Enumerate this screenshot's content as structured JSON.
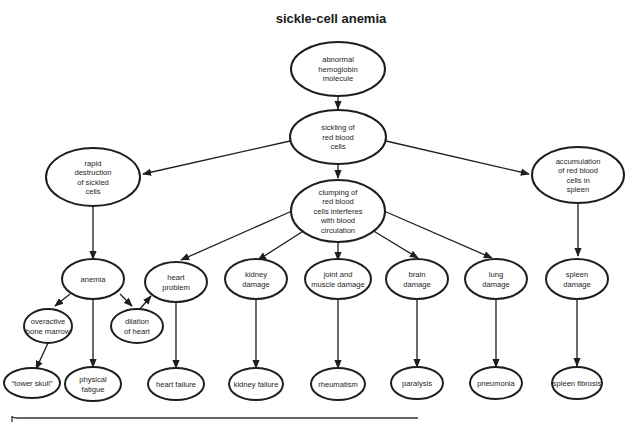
{
  "title": "sickle-cell anemia",
  "nodes": {
    "abnormal_hemoglobin": {
      "lines": [
        "abnormal",
        "hemoglobin",
        "molecule"
      ]
    },
    "sickling": {
      "lines": [
        "sickling of",
        "red blood",
        "cells"
      ]
    },
    "rapid_destruction": {
      "lines": [
        "rapid",
        "destruction",
        "of sickled",
        "cells"
      ]
    },
    "clumping": {
      "lines": [
        "clumping of",
        "red blood",
        "cells interferes",
        "with blood",
        "circulation"
      ]
    },
    "accumulation": {
      "lines": [
        "accumulation",
        "of red blood",
        "cells in",
        "spleen"
      ]
    },
    "anemia": {
      "lines": [
        "anemia"
      ]
    },
    "heart_problem": {
      "lines": [
        "heart",
        "problem"
      ]
    },
    "kidney_damage": {
      "lines": [
        "kidney",
        "damage"
      ]
    },
    "joint_muscle_damage": {
      "lines": [
        "joint and",
        "muscle damage"
      ]
    },
    "brain_damage": {
      "lines": [
        "brain",
        "damage"
      ]
    },
    "lung_damage": {
      "lines": [
        "lung",
        "damage"
      ]
    },
    "spleen_damage": {
      "lines": [
        "spleen",
        "damage"
      ]
    },
    "overactive_marrow": {
      "lines": [
        "overactive",
        "bone marrow"
      ]
    },
    "dilation_heart": {
      "lines": [
        "dilation",
        "of heart"
      ]
    },
    "tower_skull": {
      "lines": [
        "“tower skull”"
      ]
    },
    "physical_fatigue": {
      "lines": [
        "physical",
        "fatigue"
      ]
    },
    "heart_failure": {
      "lines": [
        "heart failure"
      ]
    },
    "kidney_failure": {
      "lines": [
        "kidney failure"
      ]
    },
    "rheumatism": {
      "lines": [
        "rheumatism"
      ]
    },
    "paralysis": {
      "lines": [
        "paralysis"
      ]
    },
    "pneumonia": {
      "lines": [
        "pneumonia"
      ]
    },
    "spleen_fibrosis": {
      "lines": [
        "spleen fibrosis"
      ]
    }
  },
  "edges": [
    [
      "abnormal_hemoglobin",
      "sickling"
    ],
    [
      "sickling",
      "rapid_destruction"
    ],
    [
      "sickling",
      "clumping"
    ],
    [
      "sickling",
      "accumulation"
    ],
    [
      "rapid_destruction",
      "anemia"
    ],
    [
      "clumping",
      "heart_problem"
    ],
    [
      "clumping",
      "kidney_damage"
    ],
    [
      "clumping",
      "joint_muscle_damage"
    ],
    [
      "clumping",
      "brain_damage"
    ],
    [
      "clumping",
      "lung_damage"
    ],
    [
      "accumulation",
      "spleen_damage"
    ],
    [
      "anemia",
      "overactive_marrow"
    ],
    [
      "anemia",
      "physical_fatigue"
    ],
    [
      "anemia",
      "dilation_heart"
    ],
    [
      "dilation_heart",
      "heart_problem"
    ],
    [
      "overactive_marrow",
      "tower_skull"
    ],
    [
      "heart_problem",
      "heart_failure"
    ],
    [
      "kidney_damage",
      "kidney_failure"
    ],
    [
      "joint_muscle_damage",
      "rheumatism"
    ],
    [
      "brain_damage",
      "paralysis"
    ],
    [
      "lung_damage",
      "pneumonia"
    ],
    [
      "spleen_damage",
      "spleen_fibrosis"
    ]
  ]
}
